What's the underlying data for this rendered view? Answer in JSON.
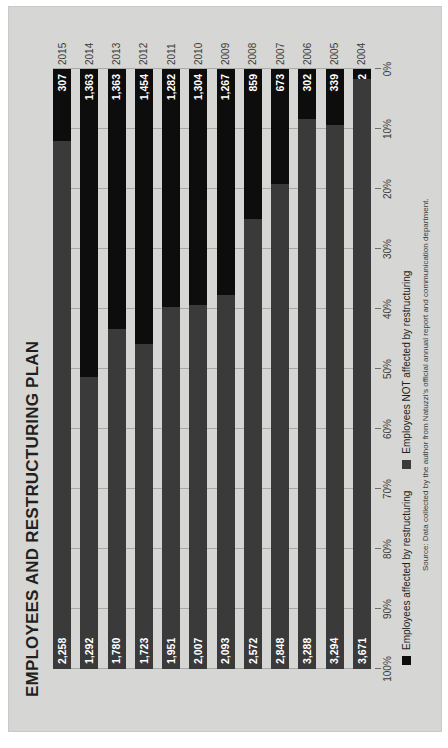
{
  "chart_data": {
    "type": "bar",
    "subtype": "stacked-100-percent-horizontal",
    "title": "EMPLOYEES AND RESTRUCTURING PLAN",
    "xlabel": "",
    "ylabel": "",
    "xlim": [
      0,
      100
    ],
    "grid": true,
    "orientation": "rotated-90-ccw",
    "legend_position": "bottom-left",
    "categories": [
      "2004",
      "2005",
      "2006",
      "2007",
      "2008",
      "2009",
      "2010",
      "2011",
      "2012",
      "2013",
      "2014",
      "2015"
    ],
    "tick_labels": [
      "0%",
      "10%",
      "20%",
      "30%",
      "40%",
      "50%",
      "60%",
      "70%",
      "80%",
      "90%",
      "100%"
    ],
    "tick_values": [
      0,
      10,
      20,
      30,
      40,
      50,
      60,
      70,
      80,
      90,
      100
    ],
    "series": [
      {
        "name": "Employees affected by restructuring",
        "color": "#0d0d0d",
        "values": [
          62,
          339,
          302,
          673,
          859,
          1267,
          1304,
          1282,
          1454,
          1363,
          1363,
          307
        ],
        "labels": [
          "62",
          "339",
          "302",
          "673",
          "859",
          "1,267",
          "1,304",
          "1,282",
          "1,454",
          "1,363",
          "1,363",
          "307"
        ]
      },
      {
        "name": "Employees NOT affected by restructuring",
        "color": "#3a3a3a",
        "values": [
          3671,
          3294,
          3288,
          2848,
          2572,
          2093,
          2007,
          1951,
          1723,
          1780,
          1292,
          2258
        ],
        "labels": [
          "3,671",
          "3,294",
          "3,288",
          "2,848",
          "2,572",
          "2,093",
          "2,007",
          "1,951",
          "1,723",
          "1,780",
          "1,292",
          "2,258"
        ]
      }
    ],
    "source_note": "Source: Data collected by the author from Natuzzi's official annual report and communication department."
  },
  "legend": {
    "items": [
      {
        "label": "Employees affected by restructuring",
        "color": "#0d0d0d"
      },
      {
        "label": "Employees NOT affected by restructuring",
        "color": "#3a3a3a"
      }
    ]
  }
}
